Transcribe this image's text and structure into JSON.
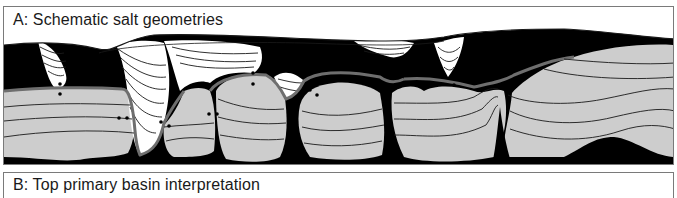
{
  "panels": [
    {
      "id": "A",
      "title": "A: Schematic salt geometries",
      "content": "schematic cross-section",
      "legend_colors": {
        "salt": "#000000",
        "primary_basin_fill": "#cdcdcd",
        "secondary_minibasin_fill": "#ffffff",
        "top_primary_basin_line": "#6e6e6e",
        "strata_lines": "#1a1a1a",
        "markers": "#000000"
      }
    },
    {
      "id": "B",
      "title": "B: Top primary basin interpretation"
    }
  ]
}
